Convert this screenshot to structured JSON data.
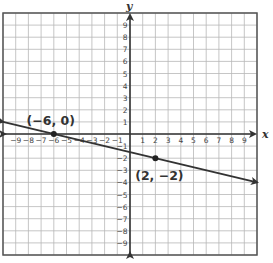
{
  "chart_data": {
    "type": "line",
    "title": "",
    "xlabel": "x",
    "ylabel": "y",
    "xlim": [
      -10,
      10
    ],
    "ylim": [
      -10,
      10
    ],
    "grid": true,
    "x_ticks": [
      -9,
      -8,
      -7,
      -6,
      -5,
      -4,
      -3,
      -2,
      -1,
      1,
      2,
      3,
      4,
      5,
      6,
      7,
      8,
      9
    ],
    "y_ticks": [
      9,
      8,
      7,
      6,
      5,
      4,
      3,
      2,
      1,
      -1,
      -2,
      -3,
      -4,
      -5,
      -6,
      -7,
      -8,
      -9
    ],
    "series": [
      {
        "name": "line",
        "x": [
          -10,
          10
        ],
        "y": [
          1,
          -4
        ],
        "color": "#333333",
        "arrows": "both"
      }
    ],
    "points": [
      {
        "x": -6,
        "y": 0,
        "label": "(−6, 0)"
      },
      {
        "x": 2,
        "y": -2,
        "label": "(2, −2)"
      }
    ]
  }
}
